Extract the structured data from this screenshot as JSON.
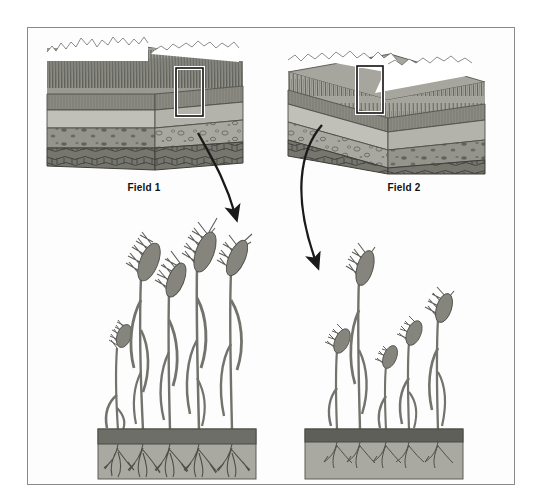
{
  "figure": {
    "kind": "scientific-illustration",
    "background_color": "#ffffff",
    "frame_border_color": "#8a8a8a"
  },
  "labels": {
    "field1": "Field 1",
    "field2": "Field 2"
  },
  "panels": [
    {
      "id": "field1-block",
      "name": "soil-block-field-1",
      "label": "Field 1",
      "canopy": "dense tall grass canopy",
      "canopy_density": "dense",
      "canopy_height_px": 42,
      "orientation": "front-right face visible",
      "soil_horizons": [
        {
          "name": "vegetation-canopy",
          "color": "#9a9a93"
        },
        {
          "name": "topsoil-A-horizon",
          "color": "#8b8b84"
        },
        {
          "name": "subsoil-B-horizon",
          "color": "#b4b4ad"
        },
        {
          "name": "mottled-C-horizon",
          "color": "#9d9d96"
        },
        {
          "name": "bedrock-R-horizon",
          "color": "#6f6f69"
        }
      ],
      "callout_box": "white-outlined sample rectangle"
    },
    {
      "id": "field2-block",
      "name": "soil-block-field-2",
      "label": "Field 2",
      "canopy": "sparse shorter grass canopy",
      "canopy_density": "sparse",
      "canopy_height_px": 30,
      "orientation": "front-left face visible",
      "soil_horizons": [
        {
          "name": "vegetation-canopy",
          "color": "#9a9a93"
        },
        {
          "name": "topsoil-A-horizon",
          "color": "#8b8b84"
        },
        {
          "name": "subsoil-B-horizon",
          "color": "#b4b4ad"
        },
        {
          "name": "mottled-C-horizon",
          "color": "#9d9d96"
        },
        {
          "name": "bedrock-R-horizon",
          "color": "#6f6f69"
        }
      ],
      "callout_box": "white-outlined sample rectangle"
    }
  ],
  "detail_views": [
    {
      "id": "field1-detail",
      "name": "wheat-detail-field-1",
      "source": "Field 1",
      "plant_count": 5,
      "plant_heights_px": [
        95,
        175,
        150,
        190,
        180
      ],
      "root_depth": "deep",
      "root_density": "dense",
      "vigor": "high",
      "soil_bed": {
        "topsoil_color": "#6e6e68",
        "subsoil_color": "#a9a9a2",
        "outline_color": "#4a4a46"
      }
    },
    {
      "id": "field2-detail",
      "name": "wheat-detail-field-2",
      "source": "Field 2",
      "plant_count": 5,
      "plant_heights_px": [
        95,
        165,
        80,
        100,
        125
      ],
      "root_depth": "shallow",
      "root_density": "sparse",
      "vigor": "low",
      "soil_bed": {
        "topsoil_color": "#5f5f59",
        "subsoil_color": "#a9a9a2",
        "outline_color": "#4a4a46"
      }
    }
  ],
  "connectors": [
    {
      "name": "arrow-field1-to-detail",
      "from": "field1-callout-box",
      "to": "field1-detail",
      "style": "curved-arrow",
      "color": "#1a1a1a"
    },
    {
      "name": "arrow-field2-to-detail",
      "from": "field2-callout-box",
      "to": "field2-detail",
      "style": "curved-arrow",
      "color": "#1a1a1a"
    }
  ],
  "palette": {
    "ink": "#1a1a1a",
    "plant_gray": "#8c8c86",
    "plant_dark": "#5a5a55",
    "soil_dark": "#6e6e68",
    "soil_light": "#a9a9a2",
    "block_top": "#9a9a93",
    "block_mid": "#b4b4ad",
    "block_low": "#6f6f69"
  }
}
